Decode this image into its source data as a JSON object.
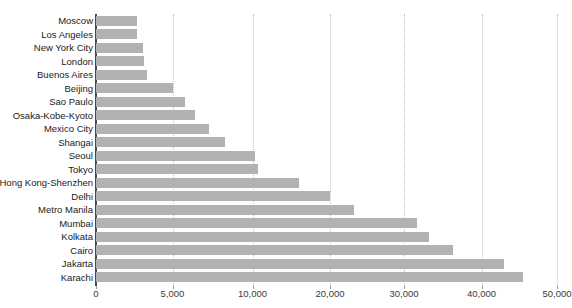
{
  "chart_data": {
    "type": "bar",
    "orientation": "horizontal",
    "title": "",
    "xlabel": "",
    "ylabel": "",
    "grid": true,
    "legend": false,
    "xlim": [
      0,
      50000
    ],
    "xticks": [
      0,
      5000,
      10000,
      20000,
      30000,
      40000,
      50000
    ],
    "xtick_labels": [
      "0",
      "5,000",
      "10,000",
      "20,000",
      "30,000",
      "40,000",
      "50,000"
    ],
    "bar_color": "#b2b2b2",
    "categories": [
      "Moscow",
      "Los Angeles",
      "New York City",
      "London",
      "Buenos Aires",
      "Beijing",
      "Sao Paulo",
      "Osaka-Kobe-Kyoto",
      "Mexico City",
      "Shangai",
      "Seoul",
      "Tokyo",
      "Hong Kong-Shenzhen",
      "Delhi",
      "Metro Manila",
      "Mumbai",
      "Kolkata",
      "Cairo",
      "Jakarta",
      "Karachi"
    ],
    "values": [
      2700,
      2700,
      3050,
      3150,
      3350,
      5000,
      5800,
      6400,
      7300,
      8300,
      10300,
      10700,
      16000,
      20000,
      23300,
      31700,
      33200,
      36300,
      43000,
      45500
    ]
  }
}
